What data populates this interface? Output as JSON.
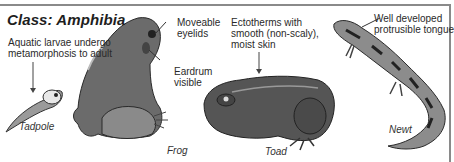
{
  "diagram": {
    "title": "Class: Amphibia",
    "annotations": {
      "larvae": [
        "Aquatic larvae undergo",
        "metamorphosis to adult"
      ],
      "eyelids": [
        "Moveable",
        "eyelids"
      ],
      "eardrum": [
        "Eardrum",
        "visible"
      ],
      "skin": [
        "Ectotherms with",
        "smooth (non-scaly),",
        "moist skin"
      ],
      "tongue": [
        "Well developed",
        "protrusible tongue"
      ]
    },
    "animals": [
      {
        "name": "Tadpole"
      },
      {
        "name": "Frog"
      },
      {
        "name": "Toad"
      },
      {
        "name": "Newt"
      }
    ],
    "colors": {
      "border": "#8a8a8a",
      "text": "#222222",
      "illustration_dark": "#3a3a3a",
      "illustration_mid": "#6e6e6e",
      "illustration_light": "#bdbdbd"
    }
  }
}
